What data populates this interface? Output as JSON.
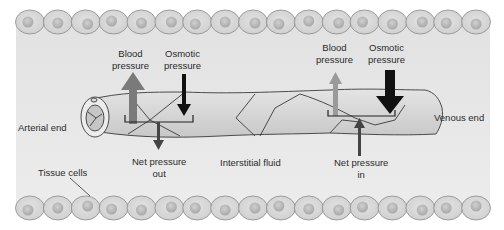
{
  "diagram": {
    "labels": {
      "arterial_end": "Arterial end",
      "venous_end": "Venous end",
      "tissue_cells": "Tissue cells",
      "interstitial_fluid": "Interstitial fluid",
      "arterial_blood_pressure": [
        "Blood",
        "pressure"
      ],
      "arterial_osmotic_pressure": [
        "Osmotic",
        "pressure"
      ],
      "venous_blood_pressure": [
        "Blood",
        "pressure"
      ],
      "venous_osmotic_pressure": [
        "Osmotic",
        "pressure"
      ],
      "net_pressure_out": [
        "Net pressure",
        "out"
      ],
      "net_pressure_in": [
        "Net pressure",
        "in"
      ]
    },
    "colors": {
      "background": "#ffffff",
      "interstitial_band": "#e6e6e6",
      "cell_fill": "#d6d6d6",
      "cell_outline": "#8a8a8a",
      "nucleus": "#b5b5b5",
      "capillary_fill": "#d4d4d4",
      "capillary_outline": "#3a3a3a",
      "blood_pressure_arrow_arterial": "#7a7a7a",
      "blood_pressure_arrow_venous": "#9a9a9a",
      "osmotic_arrow": "#111111",
      "net_arrow": "#444444"
    },
    "cell_rows": {
      "top_count": 17,
      "bottom_count": 17
    }
  }
}
